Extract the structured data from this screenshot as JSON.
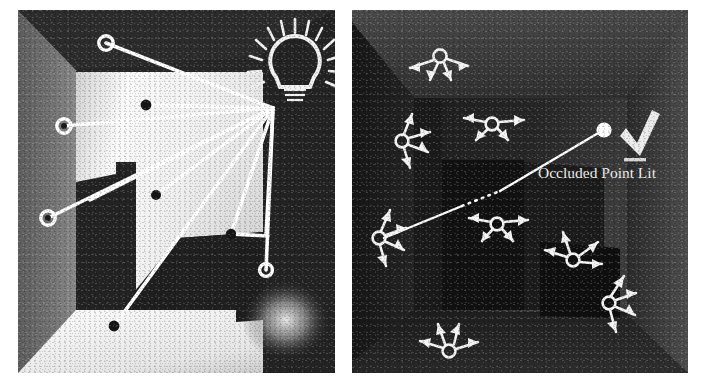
{
  "figure": {
    "background_color": "#ffffff",
    "panels": [
      {
        "id": "direct-lighting-panel",
        "position": "left",
        "description": "Lit room interior with light bulb and sample points connected by shadow rays",
        "icons": [
          {
            "name": "light-bulb-icon",
            "label": "light bulb",
            "color": "#ffffff"
          }
        ],
        "sample_points": {
          "hollow_marker_label": "unoccluded sample point",
          "filled_marker_label": "occluded sample point",
          "hollow_count": 4,
          "filled_count": 6
        },
        "ray_origin_label": "light source",
        "colors": {
          "dark_wall": "#2a2a2a",
          "left_wall": "#6e6e6e",
          "lit_wall": "#f2f2f2",
          "floor": "#f5f5f5",
          "ray": "#ffffff"
        }
      },
      {
        "id": "occlusion-panel",
        "position": "right",
        "description": "Dark room interior with directional arrow clusters and an occlusion test ray",
        "annotation": {
          "label": "Occluded Point Lit",
          "check_icon_name": "checkmark-icon",
          "check_color": "#f0f0f0",
          "text_color": "#f2f2f2"
        },
        "arrow_clusters": {
          "marker_label": "virtual point light",
          "arrows_per_cluster": 4,
          "count": 8
        },
        "ray": {
          "style": "solid-with-dotted-occluded-segment",
          "color": "#ffffff",
          "endpoint_label": "lit point"
        },
        "colors": {
          "wall": "#2b2b2b",
          "ceiling": "#3a3a3a",
          "back_wall": "#232323",
          "floor": "#1e1e1e",
          "box": "#141414"
        }
      }
    ]
  }
}
